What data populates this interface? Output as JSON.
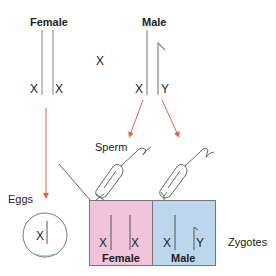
{
  "parents": {
    "female": {
      "title": "Female",
      "left_label": "X",
      "right_label": "X"
    },
    "cross_symbol": "X",
    "male": {
      "title": "Male",
      "left_label": "X",
      "right_label": "Y"
    }
  },
  "gametes": {
    "eggs_label": "Eggs",
    "egg_chromosome": "X",
    "sperm_label": "Sperm",
    "sperm_1_chromosome": "X",
    "sperm_2_chromosome": "Y"
  },
  "zygotes": {
    "label": "Zygotes",
    "female": {
      "left": "X",
      "right": "X",
      "sex": "Female",
      "color": "#f2c4dc"
    },
    "male": {
      "left": "X",
      "right": "Y",
      "sex": "Male",
      "color": "#bcd6ee"
    }
  },
  "colors": {
    "arrow": "#e8643a",
    "line": "#888888"
  }
}
